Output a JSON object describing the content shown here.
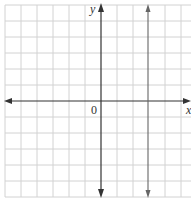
{
  "graph": {
    "x_axis_label": "x",
    "y_axis_label": "y",
    "origin_label": "0",
    "grid": {
      "columns": 12,
      "rows": 12,
      "cell_px": 16
    },
    "lines": [
      {
        "type": "vertical",
        "x": 3,
        "description": "vertical line x = 3"
      }
    ],
    "colors": {
      "grid": "#cfcfcf",
      "axis": "#333333",
      "line": "#555555"
    }
  }
}
